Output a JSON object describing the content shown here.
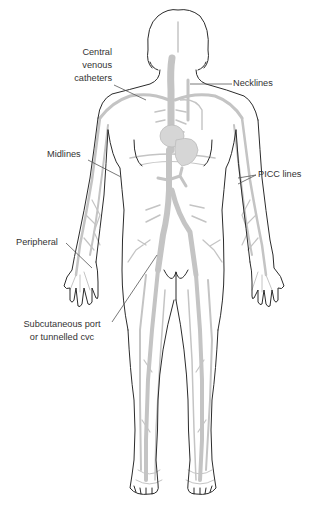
{
  "diagram": {
    "colors": {
      "background": "#ffffff",
      "outline": "#2b2b2b",
      "veins": "#c4c4c4",
      "organs": "#d6d6d6",
      "leader_lines": "#555555",
      "text": "#333333"
    },
    "labels": {
      "central_venous": {
        "line1": "Central",
        "line2": "venous",
        "line3": "catheters"
      },
      "necklines": "Necklines",
      "midlines": "Midlines",
      "picc_lines": "PICC lines",
      "peripheral": "Peripheral",
      "subcutaneous": {
        "line1": "Subcutaneous port",
        "line2": "or tunnelled cvc"
      }
    }
  }
}
